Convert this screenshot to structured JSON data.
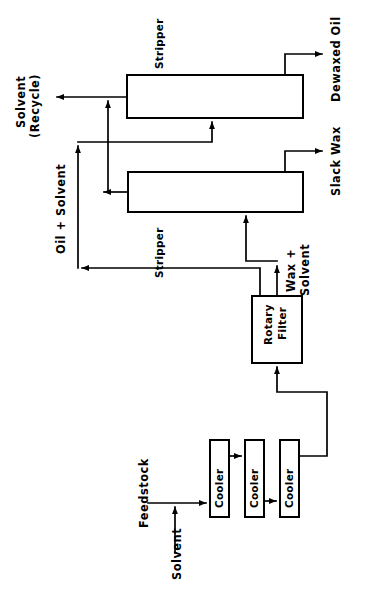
{
  "diagram": {
    "orientation": "rotated-90-ccw",
    "line_color": "#000000",
    "background_color": "#ffffff",
    "units": {
      "cooler_1": "Cooler",
      "cooler_2": "Cooler",
      "cooler_3": "Cooler",
      "rotary_filter": "Rotary\nFilter",
      "rotary_filter_line1": "Rotary",
      "rotary_filter_line2": "Filter",
      "stripper_lower": "Stripper",
      "stripper_upper": "Stripper"
    },
    "streams": {
      "feedstock": "Feedstock",
      "solvent": "Solvent",
      "wax_plus_solvent_line1": "Wax +",
      "wax_plus_solvent_line2": "Solvent",
      "oil_plus_solvent": "Oil + Solvent",
      "solvent_recycle_line1": "Solvent",
      "solvent_recycle_line2": "(Recycle)",
      "slack_wax": "Slack Wax",
      "dewaxed_oil": "Dewaxed Oil"
    }
  }
}
